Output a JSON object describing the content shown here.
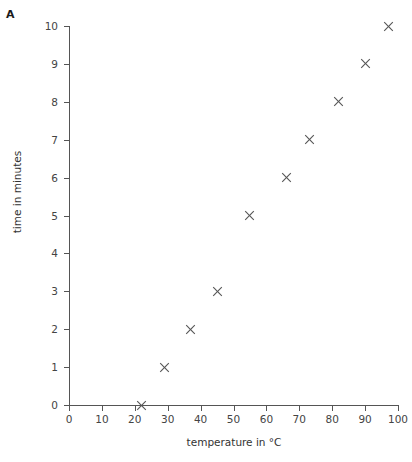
{
  "panel": {
    "label": "A"
  },
  "chart_data": {
    "type": "scatter",
    "title": "",
    "xlabel": "temperature in °C",
    "ylabel": "time in minutes",
    "xlim": [
      0,
      100
    ],
    "ylim": [
      0,
      10
    ],
    "xticks": [
      0,
      10,
      20,
      30,
      40,
      50,
      60,
      70,
      80,
      90,
      100
    ],
    "xtick_labels": [
      "0",
      "10",
      "20",
      "30",
      "40",
      "50",
      "60",
      "70",
      "80",
      "90",
      "100"
    ],
    "yticks": [
      0,
      1,
      2,
      3,
      4,
      5,
      6,
      7,
      8,
      9,
      10
    ],
    "ytick_labels": [
      "0",
      "1",
      "2",
      "3",
      "4",
      "5",
      "6",
      "7",
      "8",
      "9",
      "10"
    ],
    "grid": false,
    "legend": null,
    "marker": "x",
    "marker_color": "#555555",
    "x": [
      22,
      29,
      37,
      45,
      55,
      66,
      73,
      82,
      90,
      97
    ],
    "y": [
      0,
      1,
      2,
      3,
      5,
      6,
      7,
      8,
      9,
      10
    ],
    "points": [
      {
        "x": 22,
        "y": 0
      },
      {
        "x": 29,
        "y": 1
      },
      {
        "x": 37,
        "y": 2
      },
      {
        "x": 45,
        "y": 3
      },
      {
        "x": 55,
        "y": 5
      },
      {
        "x": 66,
        "y": 6
      },
      {
        "x": 73,
        "y": 7
      },
      {
        "x": 82,
        "y": 8
      },
      {
        "x": 90,
        "y": 9
      },
      {
        "x": 97,
        "y": 10
      }
    ]
  },
  "colors": {
    "axis": "#555555",
    "marker": "#555555",
    "text": "#333333",
    "background": "#ffffff"
  }
}
